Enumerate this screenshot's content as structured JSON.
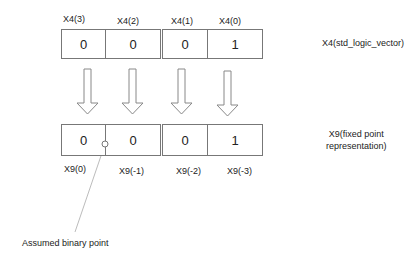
{
  "top": {
    "labels": [
      "X4(3)",
      "X4(2)",
      "X4(1)",
      "X4(0)"
    ],
    "values": [
      "0",
      "0",
      "0",
      "1"
    ],
    "caption": "X4(std_logic_vector)"
  },
  "bottom": {
    "labels": [
      "X9(0)",
      "X9(-1)",
      "X9(-2)",
      "X9(-3)"
    ],
    "values": [
      "0",
      "0",
      "0",
      "1"
    ],
    "caption_line1": "X9(fixed point",
    "caption_line2": "representation)"
  },
  "annotation": "Assumed binary point"
}
